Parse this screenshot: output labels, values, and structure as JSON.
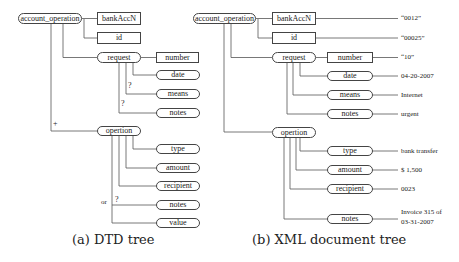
{
  "dtd_tree": {
    "caption": "(a) DTD tree",
    "root": "account_operation",
    "children": {
      "bankAccN": "bankAccN",
      "id": "id",
      "request": "request",
      "operation": "opertion"
    },
    "request_children": {
      "number": "number",
      "date": "date",
      "means": "means",
      "notes": "notes"
    },
    "operation_children": {
      "type": "type",
      "amount": "amount",
      "recipient": "recipient",
      "notes": "notes",
      "value": "value"
    },
    "cardinality": {
      "means": "?",
      "notes": "?",
      "operation": "+",
      "op_notes": "?",
      "or": "or"
    }
  },
  "xml_tree": {
    "caption": "(b) XML document tree",
    "root": "account_operation",
    "children": {
      "bankAccN": "bankAccN",
      "id": "id",
      "request": "request",
      "operation": "opertion"
    },
    "request_children": {
      "number": "number",
      "date": "date",
      "means": "means",
      "notes": "notes"
    },
    "operation_children": {
      "type": "type",
      "amount": "amount",
      "recipient": "recipient",
      "notes": "notes"
    },
    "values": {
      "bankAccN": "“0012”",
      "id": "“00025”",
      "number": "“10”",
      "date": "04-20-2007",
      "means": "Internet",
      "req_notes": "urgent",
      "type": "bank transfer",
      "amount": "$ 1,500",
      "recipient": "0023",
      "op_notes_line1": "Invoice 315 of",
      "op_notes_line2": "03-31-2007"
    }
  }
}
